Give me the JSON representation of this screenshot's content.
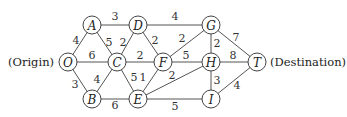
{
  "labels": {
    "origin": "(Origin)",
    "destination": "(Destination)"
  },
  "nodes": [
    {
      "id": "O",
      "x": 68,
      "y": 62
    },
    {
      "id": "A",
      "x": 92,
      "y": 25
    },
    {
      "id": "B",
      "x": 92,
      "y": 99
    },
    {
      "id": "C",
      "x": 117,
      "y": 62
    },
    {
      "id": "D",
      "x": 138,
      "y": 25
    },
    {
      "id": "E",
      "x": 138,
      "y": 99
    },
    {
      "id": "F",
      "x": 163,
      "y": 62
    },
    {
      "id": "G",
      "x": 211,
      "y": 25
    },
    {
      "id": "H",
      "x": 211,
      "y": 62
    },
    {
      "id": "I",
      "x": 211,
      "y": 99
    },
    {
      "id": "T",
      "x": 257,
      "y": 62
    }
  ],
  "edges": [
    {
      "from": "O",
      "to": "A",
      "weight": "4",
      "lx": 76,
      "ly": 40
    },
    {
      "from": "O",
      "to": "C",
      "weight": "6",
      "lx": 92,
      "ly": 55
    },
    {
      "from": "O",
      "to": "B",
      "weight": "3",
      "lx": 75,
      "ly": 84
    },
    {
      "from": "A",
      "to": "D",
      "weight": "3",
      "lx": 115,
      "ly": 16
    },
    {
      "from": "A",
      "to": "C",
      "weight": "5",
      "lx": 109,
      "ly": 42
    },
    {
      "from": "B",
      "to": "C",
      "weight": "4",
      "lx": 97,
      "ly": 79
    },
    {
      "from": "B",
      "to": "E",
      "weight": "6",
      "lx": 115,
      "ly": 105
    },
    {
      "from": "C",
      "to": "D",
      "weight": "2",
      "lx": 123,
      "ly": 42
    },
    {
      "from": "C",
      "to": "F",
      "weight": "2",
      "lx": 140,
      "ly": 55
    },
    {
      "from": "C",
      "to": "E",
      "weight": "5",
      "lx": 134,
      "ly": 77
    },
    {
      "from": "D",
      "to": "G",
      "weight": "4",
      "lx": 175,
      "ly": 16
    },
    {
      "from": "D",
      "to": "F",
      "weight": "2",
      "lx": 155,
      "ly": 40
    },
    {
      "from": "E",
      "to": "F",
      "weight": "1",
      "lx": 143,
      "ly": 77
    },
    {
      "from": "E",
      "to": "H",
      "weight": "2",
      "lx": 172,
      "ly": 75
    },
    {
      "from": "E",
      "to": "I",
      "weight": "5",
      "lx": 175,
      "ly": 106
    },
    {
      "from": "F",
      "to": "G",
      "weight": "2",
      "lx": 182,
      "ly": 38
    },
    {
      "from": "F",
      "to": "H",
      "weight": "5",
      "lx": 186,
      "ly": 55
    },
    {
      "from": "G",
      "to": "H",
      "weight": "2",
      "lx": 217,
      "ly": 43
    },
    {
      "from": "G",
      "to": "T",
      "weight": "7",
      "lx": 236,
      "ly": 37
    },
    {
      "from": "H",
      "to": "T",
      "weight": "8",
      "lx": 233,
      "ly": 55
    },
    {
      "from": "H",
      "to": "I",
      "weight": "3",
      "lx": 217,
      "ly": 80
    },
    {
      "from": "I",
      "to": "T",
      "weight": "4",
      "lx": 237,
      "ly": 85
    }
  ]
}
